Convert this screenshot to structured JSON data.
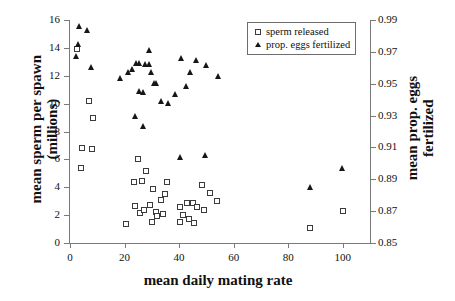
{
  "chart_data": {
    "type": "scatter",
    "title": "",
    "xlabel": "mean daily mating rate",
    "ylabel_left": "mean sperm per spawn\n(millions)",
    "ylabel_right": "mean prop. eggs\nfertilized",
    "xlim": [
      0,
      110
    ],
    "ylim_left": [
      0,
      16
    ],
    "ylim_right": [
      0.85,
      0.99
    ],
    "xticks": [
      0,
      20,
      40,
      60,
      80,
      100
    ],
    "xticklabels": [
      "0",
      "20",
      "40",
      "60",
      "80",
      "100"
    ],
    "yticks_left": [
      0,
      2,
      4,
      6,
      8,
      10,
      12,
      14,
      16
    ],
    "yticklabels_left": [
      "0",
      "2",
      "4",
      "6",
      "8",
      "10",
      "12",
      "14",
      "16"
    ],
    "yticks_right": [
      0.85,
      0.87,
      0.89,
      0.91,
      0.93,
      0.95,
      0.97,
      0.99
    ],
    "yticklabels_right": [
      "0.85",
      "0.87",
      "0.89",
      "0.91",
      "0.93",
      "0.95",
      "0.97",
      "0.99"
    ],
    "grid": false,
    "legend_position": "top-right",
    "series": [
      {
        "name": "sperm released",
        "marker": "open-square",
        "color": "#3b3b3b",
        "axis": "left",
        "points": [
          [
            2.5,
            13.95
          ],
          [
            7.0,
            10.2
          ],
          [
            8.5,
            8.95
          ],
          [
            4.5,
            6.85
          ],
          [
            8.0,
            6.75
          ],
          [
            4.0,
            5.4
          ],
          [
            20.5,
            1.35
          ],
          [
            23.5,
            4.4
          ],
          [
            24.0,
            2.65
          ],
          [
            25.5,
            2.15
          ],
          [
            26.5,
            4.45
          ],
          [
            25.0,
            6.0
          ],
          [
            27.0,
            2.35
          ],
          [
            28.0,
            5.2
          ],
          [
            29.5,
            2.75
          ],
          [
            30.0,
            1.5
          ],
          [
            30.5,
            3.85
          ],
          [
            31.5,
            2.25
          ],
          [
            32.0,
            1.95
          ],
          [
            33.5,
            3.1
          ],
          [
            34.0,
            2.05
          ],
          [
            35.0,
            3.55
          ],
          [
            35.5,
            4.4
          ],
          [
            40.5,
            2.6
          ],
          [
            40.5,
            1.5
          ],
          [
            41.5,
            2.0
          ],
          [
            43.0,
            2.85
          ],
          [
            43.5,
            1.75
          ],
          [
            45.0,
            2.9
          ],
          [
            45.5,
            1.45
          ],
          [
            46.5,
            2.6
          ],
          [
            48.5,
            4.15
          ],
          [
            49.0,
            2.35
          ],
          [
            51.5,
            3.6
          ],
          [
            54.0,
            3.0
          ],
          [
            88.0,
            1.1
          ],
          [
            100.0,
            2.3
          ]
        ]
      },
      {
        "name": "prop. eggs fertilized",
        "marker": "filled-triangle",
        "color": "#161616",
        "axis": "right",
        "points": [
          [
            3.5,
            15.55
          ],
          [
            6.5,
            15.3
          ],
          [
            3.0,
            14.25
          ],
          [
            2.5,
            13.4
          ],
          [
            8.0,
            12.65
          ],
          [
            18.5,
            11.85
          ],
          [
            21.5,
            12.3
          ],
          [
            23.0,
            12.45
          ],
          [
            24.5,
            12.9
          ],
          [
            25.5,
            12.95
          ],
          [
            27.5,
            12.85
          ],
          [
            29.0,
            12.85
          ],
          [
            27.0,
            8.4
          ],
          [
            30.0,
            12.3
          ],
          [
            31.0,
            11.5
          ],
          [
            31.5,
            11.45
          ],
          [
            25.5,
            10.9
          ],
          [
            27.0,
            10.85
          ],
          [
            24.0,
            9.1
          ],
          [
            33.5,
            10.2
          ],
          [
            29.0,
            13.85
          ],
          [
            36.0,
            10.05
          ],
          [
            38.5,
            10.7
          ],
          [
            41.0,
            13.3
          ],
          [
            44.0,
            12.25
          ],
          [
            42.5,
            11.3
          ],
          [
            46.5,
            13.15
          ],
          [
            50.0,
            12.8
          ],
          [
            54.5,
            11.95
          ],
          [
            40.5,
            6.15
          ],
          [
            49.5,
            6.3
          ],
          [
            88.0,
            4.0
          ],
          [
            100.0,
            5.35
          ]
        ]
      }
    ]
  }
}
